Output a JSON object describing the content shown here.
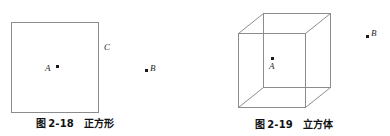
{
  "page": {
    "background_color": "#ffffff",
    "width": 390,
    "height": 136
  },
  "figures": [
    {
      "id": "figure-2-18",
      "shape": "square",
      "caption": {
        "prefix": "图",
        "number": "2-18",
        "name": "正方形",
        "full": "图 2-18  正方形"
      },
      "stroke_color": "#8c8c8c",
      "points": [
        {
          "label": "A",
          "position": "inside-square-center-left",
          "has_dot": true
        },
        {
          "label": "C",
          "position": "outside-right-upper",
          "has_dot": false
        },
        {
          "label": "B",
          "position": "outside-far-right-middle",
          "has_dot": true
        }
      ]
    },
    {
      "id": "figure-2-19",
      "shape": "cube",
      "caption": {
        "prefix": "图",
        "number": "2-19",
        "name": "立方体",
        "full": "图 2-19  立方体"
      },
      "stroke_color": "#8c8c8c",
      "points": [
        {
          "label": "A",
          "position": "inside-cube-center",
          "has_dot": true
        },
        {
          "label": "B",
          "position": "outside-right-upper",
          "has_dot": true
        }
      ]
    }
  ],
  "labels": {
    "square_A": "A",
    "square_C": "C",
    "square_B": "B",
    "cube_A": "A",
    "cube_B": "B"
  },
  "colors": {
    "line": "#8c8c8c",
    "dot": "#1a1a1a",
    "text": "#111111"
  }
}
